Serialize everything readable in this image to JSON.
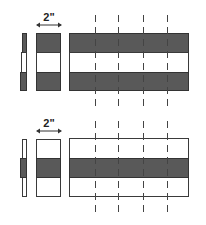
{
  "diagrams": [
    {
      "name": "top-diagram",
      "dimension_label": "2\"",
      "pattern": "dark-white-dark",
      "dashed_cut_lines": 4
    },
    {
      "name": "bottom-diagram",
      "dimension_label": "2\"",
      "pattern": "white-dark-white",
      "dashed_cut_lines": 4
    }
  ],
  "colors": {
    "dark_fill": "#595959",
    "outline": "#3a3a3a",
    "background": "#ffffff"
  }
}
